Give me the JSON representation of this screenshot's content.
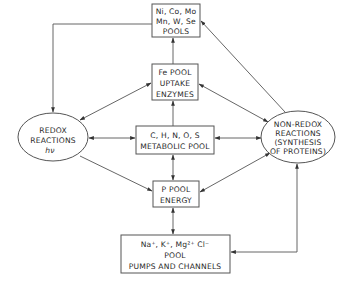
{
  "diagram": {
    "type": "flow-diagram",
    "colors": {
      "stroke": "#555555",
      "text": "#2a2a2a",
      "background": "#ffffff"
    },
    "nodes": {
      "trace_metals": {
        "shape": "box",
        "lines": [
          "Ni, Co, Mo",
          "Mn, W, Se",
          "POOLS"
        ]
      },
      "fe_pool": {
        "shape": "box",
        "lines": [
          "Fe POOL",
          "UPTAKE",
          "ENZYMES"
        ]
      },
      "chnos_pool": {
        "shape": "box",
        "lines": [
          "C, H, N, O, S",
          "METABOLIC POOL"
        ]
      },
      "p_pool": {
        "shape": "box",
        "lines": [
          "P POOL",
          "ENERGY"
        ]
      },
      "ion_pool": {
        "shape": "box",
        "lines": [
          "Na⁺, K⁺, Mg²⁺ Cl⁻",
          "POOL",
          "PUMPS AND CHANNELS"
        ]
      },
      "redox": {
        "shape": "ellipse",
        "lines": [
          "REDOX",
          "REACTIONS",
          "hν"
        ]
      },
      "non_redox": {
        "shape": "ellipse",
        "lines": [
          "NON-REDOX",
          "REACTIONS",
          "(SYNTHESIS",
          "OF PROTEINS)"
        ]
      }
    },
    "edges": [
      {
        "from": "trace_metals",
        "to": "redox",
        "direction": "one-way"
      },
      {
        "from": "fe_pool",
        "to": "trace_metals",
        "direction": "one-way"
      },
      {
        "from": "non_redox",
        "to": "trace_metals",
        "direction": "one-way"
      },
      {
        "from": "fe_pool",
        "to": "redox",
        "direction": "two-way"
      },
      {
        "from": "fe_pool",
        "to": "non_redox",
        "direction": "two-way"
      },
      {
        "from": "chnos_pool",
        "to": "fe_pool",
        "direction": "one-way"
      },
      {
        "from": "redox",
        "to": "chnos_pool",
        "direction": "two-way"
      },
      {
        "from": "chnos_pool",
        "to": "non_redox",
        "direction": "two-way"
      },
      {
        "from": "chnos_pool",
        "to": "p_pool",
        "direction": "two-way"
      },
      {
        "from": "redox",
        "to": "p_pool",
        "direction": "one-way"
      },
      {
        "from": "p_pool",
        "to": "non_redox",
        "direction": "two-way"
      },
      {
        "from": "p_pool",
        "to": "ion_pool",
        "direction": "two-way"
      },
      {
        "from": "non_redox",
        "to": "ion_pool",
        "direction": "two-way"
      }
    ]
  }
}
